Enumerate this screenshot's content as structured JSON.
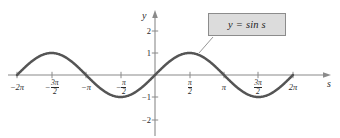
{
  "figure": {
    "background_color": "#ffffff",
    "width": 340,
    "height": 138
  },
  "axes": {
    "x_axis_name": "s",
    "y_axis_name": "y",
    "axis_color": "#8a8a8a",
    "label_color": "#2b2b2b"
  },
  "callout": {
    "text": "y = sin s",
    "fill_color": "#dcdcdc",
    "border_color": "#8c8c8c",
    "leader_color": "#8a8a8a"
  },
  "x_ticks": [
    {
      "label": "-2π",
      "value": -6.2832,
      "px": 17,
      "type": "integer-pi",
      "sign": "−",
      "coef": "2",
      "symbol": "π"
    },
    {
      "label": "-3π/2",
      "value": -4.7124,
      "px": 52,
      "type": "fraction",
      "sign": "−",
      "num": "3π",
      "den": "2"
    },
    {
      "label": "-π",
      "value": -3.1416,
      "px": 86,
      "type": "integer-pi",
      "sign": "−",
      "coef": "",
      "symbol": "π"
    },
    {
      "label": "-π/2",
      "value": -1.5708,
      "px": 121,
      "type": "fraction",
      "sign": "−",
      "num": "π",
      "den": "2"
    },
    {
      "label": "π/2",
      "value": 1.5708,
      "px": 190,
      "type": "fraction",
      "sign": "",
      "num": "π",
      "den": "2"
    },
    {
      "label": "π",
      "value": 3.1416,
      "px": 224,
      "type": "integer-pi",
      "sign": "",
      "coef": "",
      "symbol": "π"
    },
    {
      "label": "3π/2",
      "value": 4.7124,
      "px": 258,
      "type": "fraction",
      "sign": "",
      "num": "3π",
      "den": "2"
    },
    {
      "label": "2π",
      "value": 6.2832,
      "px": 293,
      "type": "integer-pi",
      "sign": "",
      "coef": "2",
      "symbol": "π"
    }
  ],
  "y_ticks": [
    {
      "label": "2",
      "value": 2,
      "px": 31
    },
    {
      "label": "1",
      "value": 1,
      "px": 53
    },
    {
      "label": "−1",
      "value": -1,
      "px": 97
    },
    {
      "label": "−2",
      "value": -2,
      "px": 120
    }
  ],
  "chart_data": {
    "type": "line",
    "title": "",
    "subtitle": "",
    "xlabel": "s",
    "ylabel": "y",
    "grid": false,
    "legend_position": "inside-annotation",
    "xlim": [
      -6.2832,
      6.2832
    ],
    "ylim": [
      -2.4,
      2.4
    ],
    "x_tick_labels": [
      "-2π",
      "-3π/2",
      "-π",
      "-π/2",
      "π/2",
      "π",
      "3π/2",
      "2π"
    ],
    "x_tick_values": [
      -6.2832,
      -4.7124,
      -3.1416,
      -1.5708,
      1.5708,
      3.1416,
      4.7124,
      6.2832
    ],
    "y_tick_labels": [
      "2",
      "1",
      "-1",
      "-2"
    ],
    "y_tick_values": [
      2,
      1,
      -1,
      -2
    ],
    "annotations": [
      {
        "text": "y = sin s",
        "points_to_x": 2.1,
        "points_to_y": 0.92
      }
    ],
    "series": [
      {
        "name": "y = sin s",
        "color": "#555555",
        "line_width": 2.5,
        "formula": "y = sin(s)",
        "x": [
          -6.2832,
          -5.8905,
          -5.4978,
          -5.1051,
          -4.7124,
          -4.3197,
          -3.927,
          -3.5343,
          -3.1416,
          -2.7489,
          -2.3562,
          -1.9635,
          -1.5708,
          -1.1781,
          -0.7854,
          -0.3927,
          0,
          0.3927,
          0.7854,
          1.1781,
          1.5708,
          1.9635,
          2.3562,
          2.7489,
          3.1416,
          3.5343,
          3.927,
          4.3197,
          4.7124,
          5.1051,
          5.4978,
          5.8905,
          6.2832
        ],
        "y": [
          0,
          0.3827,
          0.7071,
          0.9239,
          1,
          0.9239,
          0.7071,
          0.3827,
          0,
          -0.3827,
          -0.7071,
          -0.9239,
          -1,
          -0.9239,
          -0.7071,
          -0.3827,
          0,
          0.3827,
          0.7071,
          0.9239,
          1,
          0.9239,
          0.7071,
          0.3827,
          0,
          -0.3827,
          -0.7071,
          -0.9239,
          -1,
          -0.9239,
          -0.7071,
          -0.3827,
          0
        ]
      }
    ]
  },
  "geometry": {
    "origin_px": {
      "x": 155,
      "y": 75
    },
    "x_unit_px": 21.95,
    "y_unit_px": 22.0,
    "x_axis_start_px": 8,
    "x_axis_end_px": 331,
    "y_axis_top_px": 10,
    "y_axis_bottom_px": 136,
    "callout_box_px": {
      "x": 208,
      "y": 13,
      "w": 78,
      "h": 23
    },
    "leader_from_px": {
      "x": 213,
      "y": 37
    },
    "leader_to_px": {
      "x": 199,
      "y": 53
    }
  }
}
